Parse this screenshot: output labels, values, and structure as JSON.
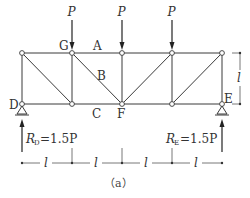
{
  "figure": {
    "caption": "（a）",
    "span_label": "l",
    "height_label": "l",
    "panel_count": 4
  },
  "loads": [
    {
      "label": "P",
      "node": "G"
    },
    {
      "label": "P",
      "node": "top-mid"
    },
    {
      "label": "P",
      "node": "top-right-inner"
    }
  ],
  "point_labels": {
    "G": "G",
    "A": "A",
    "B": "B",
    "C": "C",
    "D": "D",
    "E": "E",
    "F": "F"
  },
  "reactions": {
    "left": {
      "symbol": "R",
      "subscript": "D",
      "value": "=1.5P"
    },
    "right": {
      "symbol": "R",
      "subscript": "E",
      "value": "=1.5P"
    }
  },
  "dimensions": {
    "bottom": [
      "l",
      "l",
      "l",
      "l"
    ],
    "right": "l"
  }
}
